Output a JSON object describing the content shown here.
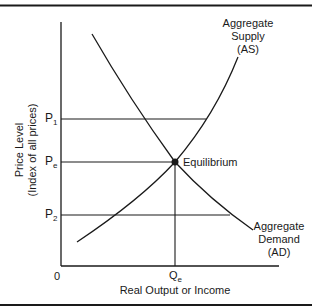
{
  "diagram": {
    "type": "aggregate supply and demand",
    "y_axis": {
      "label_line1": "Price Level",
      "label_line2": "(Index of all prices)"
    },
    "x_axis": {
      "label": "Real Output or Income",
      "origin": "0"
    },
    "price_levels": [
      {
        "base": "P",
        "sub": "1"
      },
      {
        "base": "P",
        "sub": "e"
      },
      {
        "base": "P",
        "sub": "2"
      }
    ],
    "quantity_marker": {
      "base": "Q",
      "sub": "e"
    },
    "equilibrium_label": "Equilibrium",
    "supply_curve": {
      "line1": "Aggregate",
      "line2": "Supply",
      "line3": "(AS)"
    },
    "demand_curve": {
      "line1": "Aggregate",
      "line2": "Demand",
      "line3": "(AD)"
    },
    "colors": {
      "line": "#1a1a1a",
      "background": "#ffffff"
    }
  }
}
